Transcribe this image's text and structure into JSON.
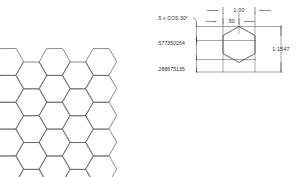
{
  "drawing": {
    "title": "Hexagon Honeycomb Pattern Engineering Drawing",
    "background_color": "#ffffff",
    "line_color": "#555555",
    "dim_line_color": "#2b2b2b",
    "text_color": "#2b2b2b"
  },
  "pattern": {
    "name": "honeycomb-tessellation",
    "orientation": "flat-top",
    "rows": 5,
    "columns": 5,
    "hex_radius": 15.5,
    "origin_x": 8,
    "origin_y": 62,
    "stroke_color": "#5a5a5a",
    "stroke_width": 0.7
  },
  "detail": {
    "name": "hexagon-detail",
    "orientation": "pointy-top",
    "center_x": 239,
    "center_y": 50,
    "half_width": 16,
    "stroke_color": "#4a4a4a",
    "stroke_width": 0.8
  },
  "dimensions": {
    "width_full": "1.00",
    "width_half": ".50",
    "cos_note": ".5 x COS 30°",
    "across_flats": ".577350264",
    "apothem": ".288675135",
    "height_full": "1.1547"
  }
}
